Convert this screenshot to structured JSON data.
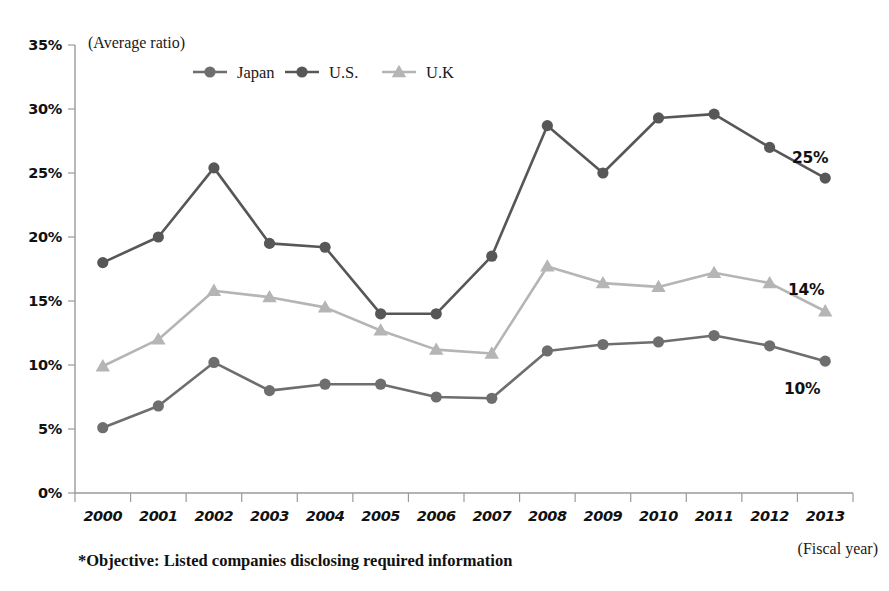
{
  "figure": {
    "y_axis_note": "(Average ratio)",
    "x_axis_note": "(Fiscal year)",
    "footnote": "*Objective: Listed companies disclosing required information"
  },
  "legend": {
    "position": "top-center",
    "entries": [
      {
        "label": "Japan",
        "marker": "circle-marker-icon",
        "color": "#6e6e6e"
      },
      {
        "label": "U.S.",
        "marker": "circle-marker-icon",
        "color": "#575757"
      },
      {
        "label": "U.K",
        "marker": "triangle-marker-icon",
        "color": "#b5b5b5"
      }
    ]
  },
  "end_labels": [
    {
      "text": "25%",
      "series": "U.S."
    },
    {
      "text": "14%",
      "series": "U.K"
    },
    {
      "text": "10%",
      "series": "Japan"
    }
  ],
  "colors": {
    "japan": "#6e6e6e",
    "us": "#575757",
    "uk": "#b5b5b5",
    "axis": "#9a9a9a",
    "text": "#111111",
    "background": "#ffffff"
  },
  "chart_data": {
    "type": "line",
    "title": "",
    "subtitle": "",
    "xlabel": "(Fiscal year)",
    "ylabel": "(Average ratio)",
    "grid": false,
    "legend_position": "top-center",
    "categories": [
      "2000",
      "2001",
      "2002",
      "2003",
      "2004",
      "2005",
      "2006",
      "2007",
      "2008",
      "2009",
      "2010",
      "2011",
      "2012",
      "2013"
    ],
    "x_tick_labels": [
      "2000",
      "2001",
      "2002",
      "2003",
      "2004",
      "2005",
      "2006",
      "2007",
      "2008",
      "2009",
      "2010",
      "2011",
      "2012",
      "2013"
    ],
    "y_tick_labels": [
      "0%",
      "5%",
      "10%",
      "15%",
      "20%",
      "25%",
      "30%",
      "35%"
    ],
    "y_tick_values": [
      0,
      5,
      10,
      15,
      20,
      25,
      30,
      35
    ],
    "ylim": [
      0,
      35
    ],
    "yunit": "%",
    "series": [
      {
        "name": "Japan",
        "color": "#6e6e6e",
        "marker": "circle",
        "values": [
          5.1,
          6.8,
          10.2,
          8.0,
          8.5,
          8.5,
          7.5,
          7.4,
          11.1,
          11.6,
          11.8,
          12.3,
          11.5,
          10.3
        ],
        "end_label": "10%"
      },
      {
        "name": "U.S.",
        "color": "#575757",
        "marker": "circle",
        "values": [
          18.0,
          20.0,
          25.4,
          19.5,
          19.2,
          14.0,
          14.0,
          18.5,
          28.7,
          25.0,
          29.3,
          29.6,
          27.0,
          24.6
        ],
        "end_label": "25%"
      },
      {
        "name": "U.K",
        "color": "#b5b5b5",
        "marker": "triangle",
        "values": [
          9.9,
          12.0,
          15.8,
          15.3,
          14.5,
          12.7,
          11.2,
          10.9,
          17.7,
          16.4,
          16.1,
          17.2,
          16.4,
          14.2
        ],
        "end_label": "14%"
      }
    ],
    "annotations": [
      "*Objective: Listed companies disclosing required information"
    ]
  }
}
